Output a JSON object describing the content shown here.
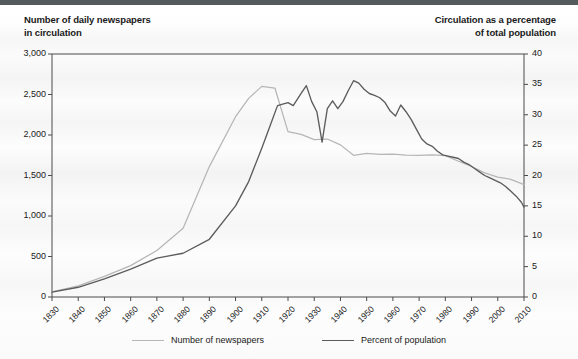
{
  "titles": {
    "left": "Number of daily newspapers\nin circulation",
    "right": "Circulation as a percentage\nof total population"
  },
  "colors": {
    "newspapers_line": "#b6b6b6",
    "percent_line": "#5c5c5c",
    "axis": "#4a4a4a",
    "background": "#fdfdfd",
    "topbar": "#555a5d"
  },
  "legend": {
    "items": [
      {
        "label": "Number of newspapers",
        "color": "#b6b6b6"
      },
      {
        "label": "Percent of population",
        "color": "#5c5c5c"
      }
    ]
  },
  "axes": {
    "x_ticks": [
      "1830",
      "1840",
      "1850",
      "1860",
      "1870",
      "1880",
      "1890",
      "1900",
      "1910",
      "1920",
      "1930",
      "1940",
      "1950",
      "1960",
      "1970",
      "1980",
      "1990",
      "2000",
      "2010"
    ],
    "y_left_ticks": [
      "0",
      "500",
      "1,000",
      "1,500",
      "2,000",
      "2,500",
      "3,000"
    ],
    "y_right_ticks": [
      "0",
      "5",
      "10",
      "15",
      "20",
      "25",
      "30",
      "35",
      "40"
    ]
  },
  "chart_data": {
    "type": "line",
    "xlabel": "",
    "ylabel": "Number of daily newspapers in circulation",
    "y2label": "Circulation as a percentage of total population",
    "xlim": [
      1830,
      2010
    ],
    "ylim": [
      0,
      3000
    ],
    "y2lim": [
      0,
      40
    ],
    "grid": false,
    "legend_position": "bottom-center",
    "series": [
      {
        "name": "Number of newspapers",
        "axis": "left",
        "color": "#b6b6b6",
        "unit": "daily newspapers",
        "x": [
          1830,
          1840,
          1850,
          1860,
          1870,
          1880,
          1890,
          1900,
          1905,
          1910,
          1915,
          1920,
          1925,
          1930,
          1935,
          1940,
          1945,
          1950,
          1955,
          1960,
          1965,
          1970,
          1975,
          1980,
          1985,
          1990,
          1995,
          2000,
          2005,
          2010
        ],
        "y": [
          65,
          138,
          254,
          387,
          574,
          850,
          1610,
          2226,
          2452,
          2600,
          2580,
          2042,
          2008,
          1942,
          1950,
          1878,
          1749,
          1772,
          1760,
          1763,
          1751,
          1748,
          1756,
          1745,
          1676,
          1611,
          1533,
          1480,
          1452,
          1387
        ]
      },
      {
        "name": "Percent of population",
        "axis": "right",
        "color": "#5c5c5c",
        "unit": "percent",
        "x": [
          1830,
          1840,
          1850,
          1860,
          1870,
          1880,
          1890,
          1900,
          1905,
          1910,
          1913,
          1916,
          1920,
          1922,
          1925,
          1927,
          1929,
          1931,
          1933,
          1935,
          1937,
          1939,
          1941,
          1943,
          1945,
          1947,
          1949,
          1951,
          1953,
          1955,
          1957,
          1959,
          1961,
          1963,
          1965,
          1967,
          1969,
          1971,
          1973,
          1975,
          1977,
          1979,
          1981,
          1983,
          1985,
          1987,
          1989,
          1991,
          1993,
          1995,
          1997,
          1999,
          2001,
          2003,
          2005,
          2007,
          2009,
          2010
        ],
        "y": [
          0.8,
          1.6,
          3.0,
          4.6,
          6.4,
          7.2,
          9.5,
          15.0,
          19.0,
          24.5,
          28.0,
          31.5,
          32.0,
          31.5,
          33.5,
          34.8,
          32.2,
          30.5,
          25.5,
          31.0,
          32.3,
          31.0,
          32.2,
          34.0,
          35.6,
          35.2,
          34.2,
          33.5,
          33.2,
          32.8,
          32.0,
          30.6,
          29.8,
          31.6,
          30.5,
          29.2,
          27.6,
          26.0,
          25.2,
          24.8,
          24.0,
          23.4,
          23.2,
          23.0,
          22.8,
          22.2,
          21.8,
          21.2,
          20.6,
          20.0,
          19.6,
          19.2,
          18.8,
          18.2,
          17.4,
          16.6,
          15.6,
          14.8
        ]
      }
    ],
    "notes": {
      "newspapers_peak": {
        "year": 1910,
        "value": 2600
      },
      "percent_peak": {
        "year": 1945,
        "value": 35.6
      },
      "percent_depression_trough": {
        "year": 1933,
        "value": 25.5
      },
      "crossover_year": 1922
    }
  }
}
